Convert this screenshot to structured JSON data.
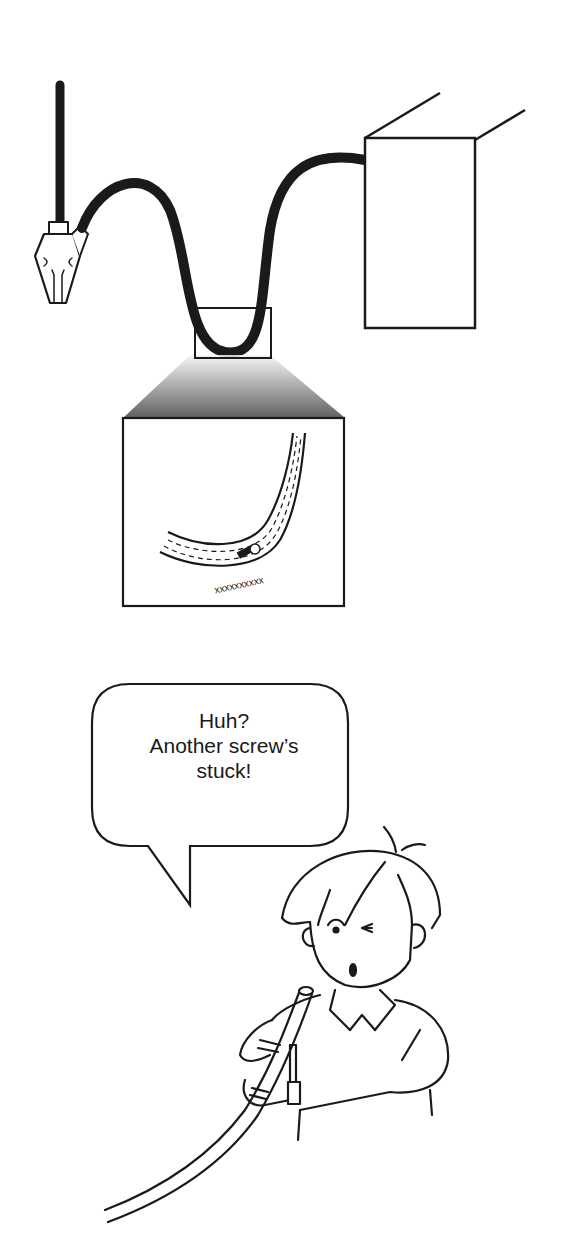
{
  "illustration": {
    "title": "Endoscope inspection scene",
    "colors": {
      "ink": "#1a1a1a",
      "background": "#ffffff",
      "gradient_dark": "#444444",
      "gradient_light": "#f4f4f4"
    },
    "top_panel": {
      "description": "Endoscope with handle, looping insertion tube into a box-shaped light source unit; zoom inset shows a screw stuck in the tube wall"
    },
    "speech_bubble": {
      "lines": [
        "Huh?",
        "Another screw’s",
        "stuck!"
      ]
    },
    "character": {
      "description": "Surprised person holding the endoscope tube"
    }
  }
}
